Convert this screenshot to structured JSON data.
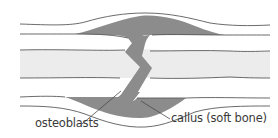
{
  "diagram": {
    "labels": {
      "osteoblasts": "osteoblasts",
      "callus": "callus (soft bone)"
    },
    "colors": {
      "background": "#ffffff",
      "callus_fill": "#8c8c8c",
      "marrow_fill": "#ececec",
      "outline": "#5a5a5a",
      "text": "#3a3a3a"
    }
  }
}
